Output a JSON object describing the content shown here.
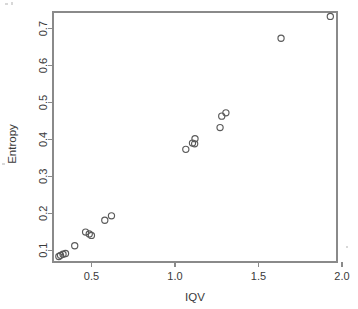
{
  "chart_data": {
    "type": "scatter",
    "title": "",
    "xlabel": "IQV",
    "ylabel": "Entropy",
    "xlim": [
      0.27,
      1.97
    ],
    "ylim": [
      0.068,
      0.745
    ],
    "xticks": [
      "0.5",
      "1.0",
      "1.5",
      "2.0"
    ],
    "xtick_values": [
      0.5,
      1.0,
      1.5,
      2.0
    ],
    "yticks": [
      "0.1",
      "0.2",
      "0.3",
      "0.4",
      "0.5",
      "0.6",
      "0.7"
    ],
    "ytick_values": [
      0.1,
      0.2,
      0.3,
      0.4,
      0.5,
      0.6,
      0.7
    ],
    "grid": false,
    "legend": "none",
    "marker": "open-circle",
    "marker_color": "#5a5a5a",
    "frame_color": "#8a8a8a",
    "x": [
      0.305,
      0.315,
      0.33,
      0.345,
      0.4,
      0.465,
      0.487,
      0.5,
      0.58,
      0.62,
      1.065,
      1.105,
      1.118,
      1.12,
      1.27,
      1.28,
      1.305,
      1.635,
      1.93
    ],
    "y": [
      0.083,
      0.086,
      0.089,
      0.091,
      0.112,
      0.149,
      0.144,
      0.14,
      0.181,
      0.193,
      0.373,
      0.39,
      0.388,
      0.402,
      0.432,
      0.463,
      0.472,
      0.674,
      0.733
    ],
    "points": [
      {
        "x": 0.305,
        "y": 0.083
      },
      {
        "x": 0.315,
        "y": 0.086
      },
      {
        "x": 0.33,
        "y": 0.089
      },
      {
        "x": 0.345,
        "y": 0.091
      },
      {
        "x": 0.4,
        "y": 0.112
      },
      {
        "x": 0.465,
        "y": 0.149
      },
      {
        "x": 0.487,
        "y": 0.144
      },
      {
        "x": 0.5,
        "y": 0.14
      },
      {
        "x": 0.58,
        "y": 0.181
      },
      {
        "x": 0.62,
        "y": 0.193
      },
      {
        "x": 1.065,
        "y": 0.373
      },
      {
        "x": 1.105,
        "y": 0.39
      },
      {
        "x": 1.118,
        "y": 0.388
      },
      {
        "x": 1.12,
        "y": 0.402
      },
      {
        "x": 1.27,
        "y": 0.432
      },
      {
        "x": 1.28,
        "y": 0.463
      },
      {
        "x": 1.305,
        "y": 0.472
      },
      {
        "x": 1.635,
        "y": 0.674
      },
      {
        "x": 1.93,
        "y": 0.733
      }
    ]
  },
  "plot_geometry": {
    "left": 53,
    "right": 337,
    "top": 12,
    "bottom": 262,
    "marker_radius": 3.1
  }
}
